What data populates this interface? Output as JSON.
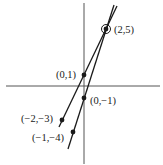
{
  "diagram": {
    "type": "coordinate-graph",
    "axes": {
      "x_axis": true,
      "y_axis": true,
      "color": "#555555"
    },
    "lines": [
      {
        "name": "line-1",
        "through": [
          [
            -2,
            -3
          ],
          [
            0,
            1
          ],
          [
            2,
            5
          ]
        ],
        "color": "#1a1a1a"
      },
      {
        "name": "line-2",
        "through": [
          [
            -1,
            -4
          ],
          [
            0,
            -1
          ],
          [
            2,
            5
          ]
        ],
        "color": "#1a1a1a"
      }
    ],
    "points": [
      {
        "label": "(2,5)",
        "x": 2,
        "y": 5,
        "circled": true
      },
      {
        "label": "(0,1)",
        "x": 0,
        "y": 1
      },
      {
        "label": "(0,−1)",
        "x": 0,
        "y": -1
      },
      {
        "label": "(−2,−3)",
        "x": -2,
        "y": -3
      },
      {
        "label": "(−1,−4)",
        "x": -1,
        "y": -4
      }
    ]
  }
}
